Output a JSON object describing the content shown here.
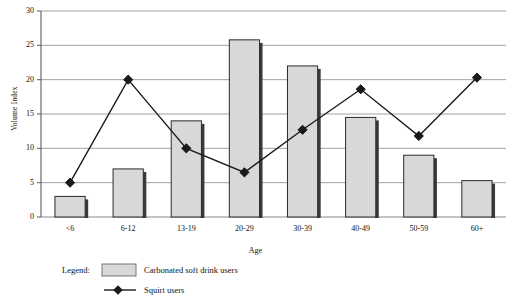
{
  "chart_data": {
    "type": "bar",
    "title": "",
    "xlabel": "Age",
    "ylabel": "Volume Index",
    "categories": [
      "<6",
      "6-12",
      "13-19",
      "20-29",
      "30-39",
      "40-49",
      "50-59",
      "60+"
    ],
    "ylim": [
      0,
      30
    ],
    "yticks": [
      0,
      5,
      10,
      15,
      20,
      25,
      30
    ],
    "grid": true,
    "legend_position": "below-left",
    "legend_title": "Legend:",
    "series": [
      {
        "name": "Carbonated soft drink users",
        "type": "bar",
        "color": "#d8d8d8",
        "values": [
          3.0,
          7.0,
          14.0,
          25.8,
          22.0,
          14.5,
          9.0,
          5.3
        ]
      },
      {
        "name": "Squirt users",
        "type": "line",
        "color": "#1a1a1a",
        "marker": "diamond",
        "values": [
          5.0,
          20.0,
          10.0,
          6.5,
          12.7,
          18.6,
          11.8,
          20.3
        ]
      }
    ]
  },
  "axis": {
    "y_tick_labels": [
      "0",
      "5",
      "10",
      "15",
      "20",
      "25",
      "30"
    ],
    "x_tick_labels": [
      "<6",
      "6-12",
      "13-19",
      "20-29",
      "30-39",
      "40-49",
      "50-59",
      "60+"
    ],
    "y_title": "Volume Index",
    "x_title": "Age"
  },
  "legend": {
    "title": "Legend:",
    "entries": [
      {
        "label": "Carbonated soft drink users",
        "swatch": "bar-swatch-icon"
      },
      {
        "label": "Squirt users",
        "swatch": "diamond-marker-icon"
      }
    ]
  }
}
